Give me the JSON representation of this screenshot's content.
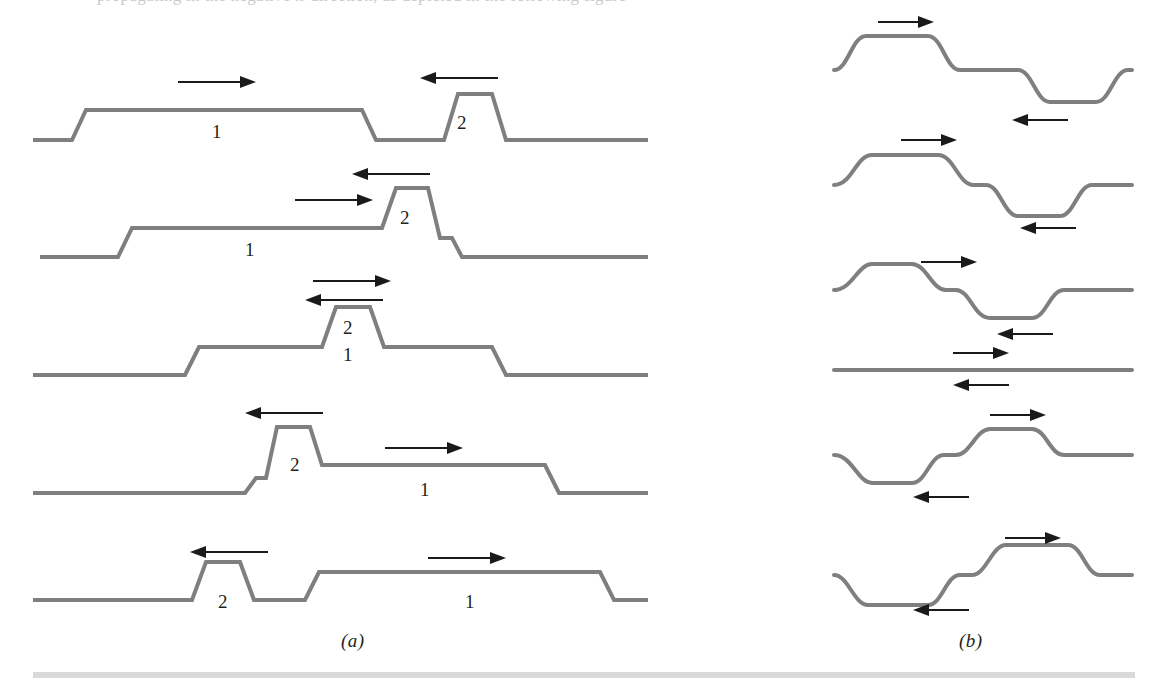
{
  "figure": {
    "kind": "physics-diagram",
    "line_color": "#7f7f7f",
    "arrow_color": "#1a1a1a",
    "rule_color": "#d9d9d9",
    "background": "#ffffff",
    "top_trim_text": "propagating in the negative x-direction, as depicted in the following figure"
  },
  "panels": [
    {
      "id": "a",
      "caption": "(a)",
      "description": "constructive interference of two upward pulses traveling toward each other",
      "corner_style": "angular",
      "rows": [
        {
          "index": 1,
          "labels": [
            {
              "text": "1",
              "x": 212,
              "y": 122
            },
            {
              "text": "2",
              "x": 457,
              "y": 113
            }
          ],
          "arrows": [
            {
              "direction": "right",
              "x": 178,
              "y": 82,
              "length": 78
            },
            {
              "direction": "left",
              "x": 420,
              "y": 78,
              "length": 78
            }
          ]
        },
        {
          "index": 2,
          "labels": [
            {
              "text": "1",
              "x": 245,
              "y": 240
            },
            {
              "text": "2",
              "x": 400,
              "y": 208
            }
          ],
          "arrows": [
            {
              "direction": "right",
              "x": 295,
              "y": 200,
              "length": 78
            },
            {
              "direction": "left",
              "x": 352,
              "y": 174,
              "length": 78
            }
          ]
        },
        {
          "index": 3,
          "labels": [
            {
              "text": "2",
              "x": 343,
              "y": 318
            },
            {
              "text": "1",
              "x": 343,
              "y": 345
            }
          ],
          "arrows": [
            {
              "direction": "right",
              "x": 313,
              "y": 281,
              "length": 78
            },
            {
              "direction": "left",
              "x": 305,
              "y": 298,
              "length": 78
            }
          ]
        },
        {
          "index": 4,
          "labels": [
            {
              "text": "2",
              "x": 290,
              "y": 455
            },
            {
              "text": "1",
              "x": 420,
              "y": 480
            }
          ],
          "arrows": [
            {
              "direction": "left",
              "x": 245,
              "y": 413,
              "length": 78
            },
            {
              "direction": "right",
              "x": 385,
              "y": 448,
              "length": 78
            }
          ]
        },
        {
          "index": 5,
          "labels": [
            {
              "text": "2",
              "x": 218,
              "y": 592
            },
            {
              "text": "1",
              "x": 465,
              "y": 592
            }
          ],
          "arrows": [
            {
              "direction": "left",
              "x": 190,
              "y": 552,
              "length": 78
            },
            {
              "direction": "right",
              "x": 428,
              "y": 558,
              "length": 78
            }
          ]
        }
      ]
    },
    {
      "id": "b",
      "caption": "(b)",
      "description": "destructive interference of an upward pulse and a downward pulse, with complete cancellation at the middle row",
      "corner_style": "rounded",
      "rows": [
        {
          "index": 1,
          "labels": [],
          "arrows": [
            {
              "direction": "right",
              "x": 878,
              "y": 22,
              "length": 56
            },
            {
              "direction": "left",
              "x": 1012,
              "y": 120,
              "length": 56
            }
          ]
        },
        {
          "index": 2,
          "labels": [],
          "arrows": [
            {
              "direction": "right",
              "x": 901,
              "y": 140,
              "length": 56
            },
            {
              "direction": "left",
              "x": 1020,
              "y": 228,
              "length": 56
            }
          ]
        },
        {
          "index": 3,
          "labels": [],
          "arrows": [
            {
              "direction": "right",
              "x": 921,
              "y": 262,
              "length": 56
            },
            {
              "direction": "left",
              "x": 997,
              "y": 334,
              "length": 56
            }
          ]
        },
        {
          "index": 4,
          "labels": [],
          "arrows": [
            {
              "direction": "right",
              "x": 953,
              "y": 353,
              "length": 56
            },
            {
              "direction": "left",
              "x": 953,
              "y": 385,
              "length": 56
            }
          ]
        },
        {
          "index": 5,
          "labels": [],
          "arrows": [
            {
              "direction": "right",
              "x": 990,
              "y": 415,
              "length": 56
            },
            {
              "direction": "left",
              "x": 913,
              "y": 497,
              "length": 56
            }
          ]
        },
        {
          "index": 6,
          "labels": [],
          "arrows": [
            {
              "direction": "right",
              "x": 1005,
              "y": 538,
              "length": 56
            },
            {
              "direction": "left",
              "x": 913,
              "y": 610,
              "length": 56
            }
          ]
        }
      ]
    }
  ],
  "captions": {
    "a": {
      "text": "(a)",
      "x": 341,
      "y": 630
    },
    "b": {
      "text": "(b)",
      "x": 959,
      "y": 630
    }
  }
}
